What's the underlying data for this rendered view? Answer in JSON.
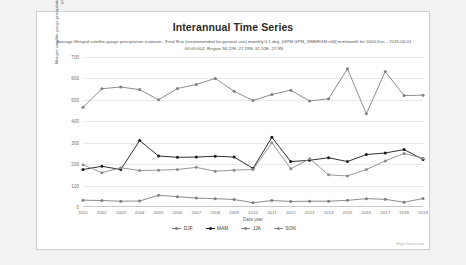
{
  "chart": {
    "title": "Interannual Time Series",
    "subtitle": "Average Merged satellite-gauge precipitation estimate - Final Run (recommended for general use) monthly 0.1 deg. [GPM GPM_3IMERGM v06] mm/month for 2000-Dec - 2019-03-01 00:00:00Z, Region 94.22E, 27.29N, 91.52E, 27.9N",
    "watermark": "Highcharts.com"
  },
  "chart_data": {
    "type": "line",
    "title": "Interannual Time Series",
    "subtitle": "Average Merged satellite-gauge precipitation estimate - Final Run (recommended for general use) monthly 0.1 deg. [GPM GPM_3IMERGM v06] mm/month for 2000-Dec - 2019-03-01 00:00:00Z, Region 94.22E, 27.29N, 91.52E, 27.9N",
    "xlabel": "Data year",
    "ylabel": "Merged satellite-gauge precipitation estimate - Final Run (recommended for general use)",
    "ylim": [
      0,
      700
    ],
    "yticks": [
      0,
      100,
      200,
      300,
      400,
      500,
      600,
      700
    ],
    "grid": true,
    "legend_position": "bottom",
    "categories": [
      2001,
      2002,
      2003,
      2004,
      2005,
      2006,
      2007,
      2008,
      2009,
      2010,
      2011,
      2012,
      2013,
      2014,
      2015,
      2016,
      2017,
      2018,
      2019
    ],
    "series": [
      {
        "name": "DJF",
        "color": "#7f7f7f",
        "values": [
          32,
          30,
          27,
          28,
          55,
          48,
          42,
          39,
          35,
          20,
          30,
          26,
          27,
          27,
          31,
          39,
          36,
          22,
          40
        ]
      },
      {
        "name": "MAM",
        "color": "#1a1a1a",
        "values": [
          175,
          190,
          175,
          310,
          238,
          232,
          233,
          237,
          233,
          180,
          325,
          212,
          218,
          230,
          212,
          245,
          252,
          268,
          222
        ]
      },
      {
        "name": "JJA",
        "color": "#808080",
        "values": [
          465,
          552,
          560,
          548,
          500,
          553,
          572,
          600,
          540,
          497,
          525,
          545,
          495,
          505,
          645,
          435,
          632,
          520,
          522
        ]
      },
      {
        "name": "SON",
        "color": "#8c8c8c",
        "values": [
          197,
          160,
          183,
          170,
          172,
          175,
          185,
          167,
          172,
          175,
          300,
          178,
          225,
          150,
          145,
          175,
          215,
          250,
          228
        ]
      }
    ]
  },
  "legend": [
    {
      "label": "DJF"
    },
    {
      "label": "MAM"
    },
    {
      "label": "JJA"
    },
    {
      "label": "SON"
    }
  ]
}
